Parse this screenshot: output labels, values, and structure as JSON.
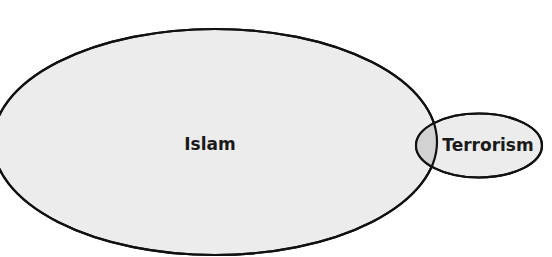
{
  "diagram": {
    "type": "venn",
    "colors": {
      "background": "#ffffff",
      "set_fill": "#ececec",
      "overlap_fill": "#d2d2d2",
      "stroke": "#111111",
      "text": "#1a1a1a"
    },
    "sets": [
      {
        "id": "islam",
        "label": "Islam",
        "shape": {
          "cx": 215,
          "cy": 142,
          "rx": 222,
          "ry": 113
        },
        "label_pos": {
          "x": 210,
          "y": 150
        }
      },
      {
        "id": "terrorism",
        "label": "Terrorism",
        "shape": {
          "cx": 479,
          "cy": 145.5,
          "rx": 63,
          "ry": 32
        },
        "label_pos": {
          "x": 488,
          "y": 151
        }
      }
    ],
    "overlap": {
      "between": [
        "Islam",
        "Terrorism"
      ],
      "label": ""
    }
  }
}
